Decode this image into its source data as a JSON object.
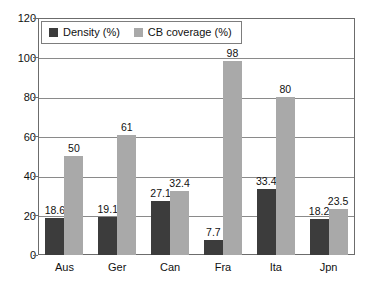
{
  "chart_data": {
    "type": "bar",
    "title": "",
    "subtitle": "",
    "xlabel": "",
    "ylabel": "",
    "categories": [
      "Aus",
      "Ger",
      "Can",
      "Fra",
      "Ita",
      "Jpn"
    ],
    "series": [
      {
        "name": "Density (%)",
        "color": "#3c3c3c",
        "values": [
          18.6,
          19.1,
          27.1,
          7.7,
          33.4,
          18.2
        ],
        "labels": [
          "18.6",
          "19.1",
          "27.1",
          "7.7",
          "33.4",
          "18.2"
        ]
      },
      {
        "name": "CB coverage (%)",
        "color": "#a9a9a9",
        "values": [
          50,
          61,
          32.4,
          98,
          80,
          23.5
        ],
        "labels": [
          "50",
          "61",
          "32.4",
          "98",
          "80",
          "23.5"
        ]
      }
    ],
    "ylim": [
      0,
      120
    ],
    "yticks": [
      0,
      20,
      40,
      60,
      80,
      100,
      120
    ],
    "ytick_labels": [
      "0",
      "20",
      "40",
      "60",
      "80",
      "100",
      "120"
    ],
    "grid": "horizontal",
    "legend_position": "top-left",
    "data_labels": true
  },
  "legend": {
    "items": [
      {
        "label": "Density (%)",
        "color": "#3c3c3c"
      },
      {
        "label": "CB coverage (%)",
        "color": "#a9a9a9"
      }
    ]
  }
}
